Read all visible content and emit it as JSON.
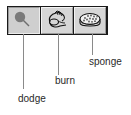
{
  "toolbar": {
    "tools": [
      {
        "id": "dodge",
        "label": "dodge",
        "icon": "dodge-icon",
        "selected": true
      },
      {
        "id": "burn",
        "label": "burn",
        "icon": "burn-icon",
        "selected": false
      },
      {
        "id": "sponge",
        "label": "sponge",
        "icon": "sponge-icon",
        "selected": false
      }
    ]
  },
  "colors": {
    "border": "#1a1a1a",
    "button_face": "#d6d6d6",
    "leader_line": "#8a8a8a",
    "label_text": "#2a2a2a"
  }
}
